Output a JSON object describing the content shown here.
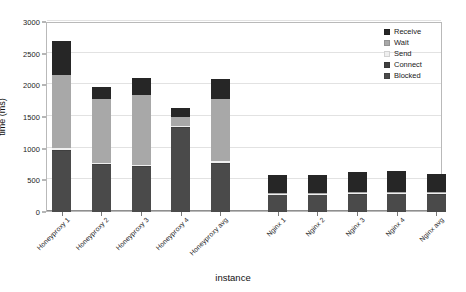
{
  "chart_data": {
    "type": "bar",
    "stacked": true,
    "title": "",
    "xlabel": "instance",
    "ylabel": "time (ms)",
    "ylim": [
      0,
      3000
    ],
    "ytick_step": 500,
    "yticks": [
      0,
      500,
      1000,
      1500,
      2000,
      2500,
      3000
    ],
    "ytick_labels": [
      "0",
      "500",
      "1000",
      "1500",
      "2000",
      "2500",
      "3000"
    ],
    "grid": true,
    "grid_axis": "y",
    "legend_position": "top-right",
    "categories": [
      "Honeyproxy 1",
      "Honeyproxy 2",
      "Honeyproxy 3",
      "Honeyproxy 4",
      "Honeyproxy avg",
      "Nginx 1",
      "Nginx 2",
      "Nginx 3",
      "Nginx 4",
      "Nginx avg"
    ],
    "series": [
      {
        "name": "Blocked",
        "color": "#4a4a4a",
        "values": [
          960,
          745,
          705,
          1320,
          765,
          265,
          265,
          275,
          280,
          270
        ]
      },
      {
        "name": "Connect",
        "color": "#3f3f3f",
        "values": [
          20,
          15,
          15,
          20,
          15,
          10,
          10,
          10,
          10,
          10
        ]
      },
      {
        "name": "Send",
        "color": "#efefef",
        "values": [
          25,
          20,
          20,
          20,
          20,
          15,
          15,
          15,
          15,
          15
        ]
      },
      {
        "name": "Wait",
        "color": "#a8a8a8",
        "values": [
          1165,
          1010,
          1100,
          140,
          990,
          15,
          15,
          15,
          15,
          15
        ]
      },
      {
        "name": "Receive",
        "color": "#262626",
        "values": [
          530,
          185,
          270,
          150,
          315,
          280,
          285,
          310,
          320,
          290
        ]
      }
    ],
    "totals": [
      2700,
      1975,
      2110,
      1650,
      2105,
      585,
      590,
      625,
      640,
      600
    ]
  },
  "legend": {
    "items": [
      {
        "label": "Receive",
        "color": "#262626"
      },
      {
        "label": "Wait",
        "color": "#a8a8a8"
      },
      {
        "label": "Send",
        "color": "#efefef"
      },
      {
        "label": "Connect",
        "color": "#3f3f3f"
      },
      {
        "label": "Blocked",
        "color": "#4a4a4a"
      }
    ]
  },
  "axes": {
    "y_title": "time (ms)",
    "x_title": "instance"
  }
}
